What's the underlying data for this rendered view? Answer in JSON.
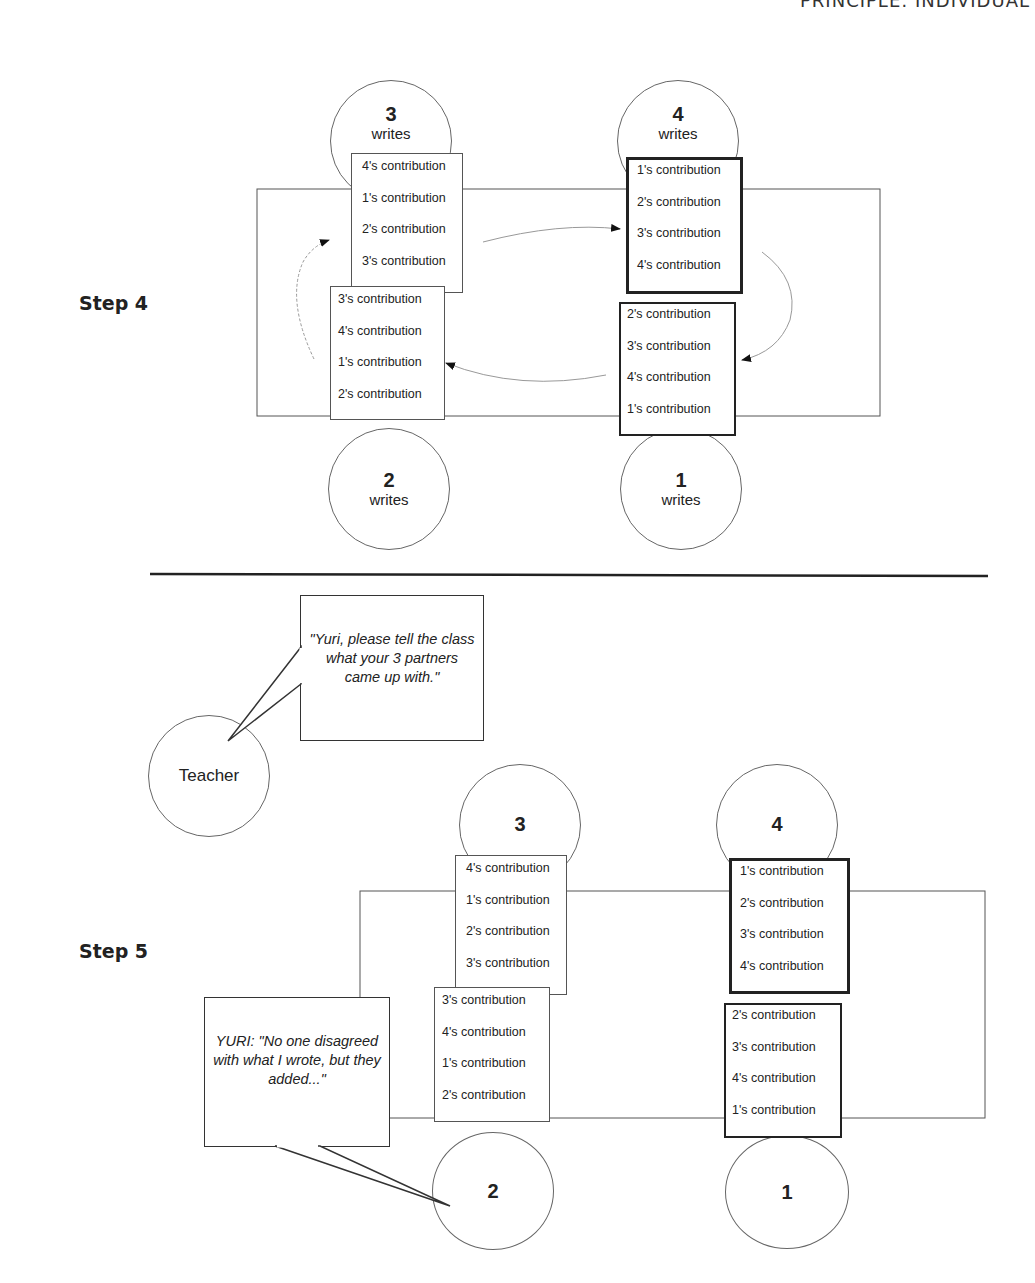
{
  "page_header": "PRINCIPLE: INDIVIDUAL",
  "step4": {
    "label": "Step 4",
    "students": {
      "s3": {
        "number": "3",
        "action": "writes"
      },
      "s4": {
        "number": "4",
        "action": "writes"
      },
      "s2": {
        "number": "2",
        "action": "writes"
      },
      "s1": {
        "number": "1",
        "action": "writes"
      }
    },
    "cards": {
      "s3": [
        "4's contribution",
        "1's contribution",
        "2's contribution",
        "3's contribution"
      ],
      "s4": [
        "1's contribution",
        "2's contribution",
        "3's contribution",
        "4's contribution"
      ],
      "s2": [
        "3's contribution",
        "4's contribution",
        "1's contribution",
        "2's contribution"
      ],
      "s1": [
        "2's contribution",
        "3's contribution",
        "4's contribution",
        "1's contribution"
      ]
    }
  },
  "step5": {
    "label": "Step 5",
    "teacher": {
      "label": "Teacher",
      "speech": "\"Yuri, please tell the class what your 3 partners came up with.\""
    },
    "yuri_speech": "YURI: \"No one disagreed with what I wrote, but they added...\"",
    "students": {
      "s3": {
        "number": "3"
      },
      "s4": {
        "number": "4"
      },
      "s2": {
        "number": "2"
      },
      "s1": {
        "number": "1"
      }
    },
    "cards": {
      "s3": [
        "4's contribution",
        "1's contribution",
        "2's contribution",
        "3's contribution"
      ],
      "s4": [
        "1's contribution",
        "2's contribution",
        "3's contribution",
        "4's contribution"
      ],
      "s2": [
        "3's contribution",
        "4's contribution",
        "1's contribution",
        "2's contribution"
      ],
      "s1": [
        "2's contribution",
        "3's contribution",
        "4's contribution",
        "1's contribution"
      ]
    }
  }
}
